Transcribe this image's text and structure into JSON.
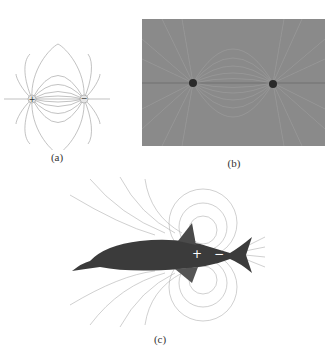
{
  "figure": {
    "panels": [
      {
        "id": "a",
        "label": "(a)",
        "description": "Electric dipole field line diagram",
        "charges": [
          "+",
          "−"
        ]
      },
      {
        "id": "b",
        "label": "(b)",
        "description": "Photograph of field line pattern around two charges"
      },
      {
        "id": "c",
        "label": "(c)",
        "description": "Electric fish with dipole field lines",
        "charges": [
          "+",
          "−"
        ]
      }
    ],
    "colors": {
      "field_line": "#9a9a9a",
      "photo_bg": "#8c8c8c",
      "fish_body": "#3a3a3a",
      "charge_dot": "#2a2a2a"
    }
  }
}
